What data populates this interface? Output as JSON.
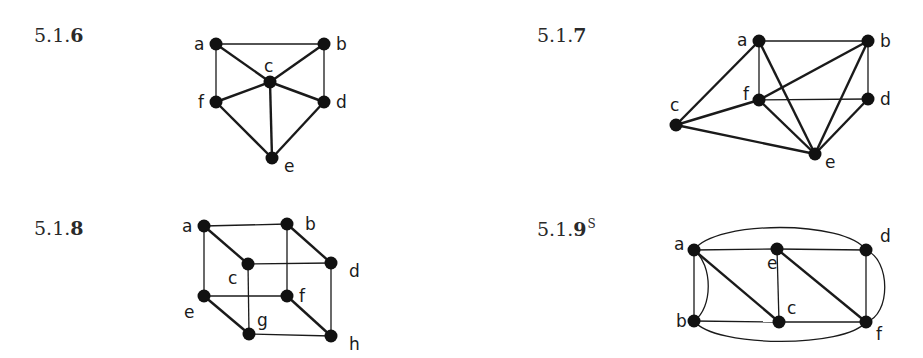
{
  "exercises": [
    {
      "id": "5.1.6",
      "label_prefix": "5.1.",
      "label_bold": "6",
      "superscript": "",
      "vertices": [
        {
          "name": "a",
          "x": 216,
          "y": 44
        },
        {
          "name": "b",
          "x": 324,
          "y": 44
        },
        {
          "name": "c",
          "x": 270,
          "y": 82
        },
        {
          "name": "d",
          "x": 324,
          "y": 102
        },
        {
          "name": "e",
          "x": 272,
          "y": 158
        },
        {
          "name": "f",
          "x": 216,
          "y": 102
        }
      ],
      "edges": [
        [
          "a",
          "b"
        ],
        [
          "a",
          "c"
        ],
        [
          "a",
          "f"
        ],
        [
          "b",
          "c"
        ],
        [
          "b",
          "d"
        ],
        [
          "c",
          "f"
        ],
        [
          "c",
          "d"
        ],
        [
          "c",
          "e"
        ],
        [
          "f",
          "e"
        ],
        [
          "d",
          "e"
        ]
      ]
    },
    {
      "id": "5.1.7",
      "label_prefix": "5.1.",
      "label_bold": "7",
      "superscript": "",
      "vertices": [
        {
          "name": "a",
          "x": 759,
          "y": 41
        },
        {
          "name": "b",
          "x": 868,
          "y": 41
        },
        {
          "name": "c",
          "x": 676,
          "y": 125
        },
        {
          "name": "d",
          "x": 868,
          "y": 99
        },
        {
          "name": "e",
          "x": 815,
          "y": 154
        },
        {
          "name": "f",
          "x": 759,
          "y": 100
        }
      ],
      "edges": [
        [
          "a",
          "b"
        ],
        [
          "a",
          "c"
        ],
        [
          "a",
          "f"
        ],
        [
          "a",
          "e"
        ],
        [
          "b",
          "f"
        ],
        [
          "b",
          "e"
        ],
        [
          "b",
          "d"
        ],
        [
          "c",
          "f"
        ],
        [
          "c",
          "e"
        ],
        [
          "f",
          "d"
        ],
        [
          "f",
          "e"
        ],
        [
          "d",
          "e"
        ]
      ]
    },
    {
      "id": "5.1.8",
      "label_prefix": "5.1.",
      "label_bold": "8",
      "superscript": "",
      "vertices": [
        {
          "name": "a",
          "x": 204,
          "y": 226
        },
        {
          "name": "b",
          "x": 287,
          "y": 224
        },
        {
          "name": "c",
          "x": 248,
          "y": 264
        },
        {
          "name": "d",
          "x": 331,
          "y": 263
        },
        {
          "name": "e",
          "x": 204,
          "y": 296
        },
        {
          "name": "f",
          "x": 287,
          "y": 296
        },
        {
          "name": "g",
          "x": 249,
          "y": 334
        },
        {
          "name": "h",
          "x": 331,
          "y": 336
        }
      ],
      "edges": [
        [
          "a",
          "b"
        ],
        [
          "a",
          "c"
        ],
        [
          "a",
          "e"
        ],
        [
          "b",
          "d"
        ],
        [
          "b",
          "f"
        ],
        [
          "c",
          "d"
        ],
        [
          "c",
          "g"
        ],
        [
          "d",
          "h"
        ],
        [
          "e",
          "f"
        ],
        [
          "e",
          "g"
        ],
        [
          "f",
          "h"
        ],
        [
          "g",
          "h"
        ]
      ]
    },
    {
      "id": "5.1.9s",
      "label_prefix": "5.1.",
      "label_bold": "9",
      "superscript": "S",
      "vertices": [
        {
          "name": "a",
          "x": 694,
          "y": 250
        },
        {
          "name": "b",
          "x": 694,
          "y": 321
        },
        {
          "name": "c",
          "x": 779,
          "y": 322
        },
        {
          "name": "d",
          "x": 866,
          "y": 250
        },
        {
          "name": "e",
          "x": 777,
          "y": 249
        },
        {
          "name": "f",
          "x": 866,
          "y": 322
        }
      ],
      "edges": [
        [
          "a",
          "e"
        ],
        [
          "e",
          "d"
        ],
        [
          "a",
          "b"
        ],
        [
          "a",
          "c"
        ],
        [
          "e",
          "c"
        ],
        [
          "e",
          "f"
        ],
        [
          "d",
          "f"
        ],
        [
          "b",
          "c"
        ],
        [
          "c",
          "f"
        ]
      ],
      "curved_edges": [
        [
          "a",
          "b"
        ],
        [
          "d",
          "f"
        ],
        [
          "a",
          "d"
        ],
        [
          "b",
          "f"
        ]
      ]
    }
  ]
}
